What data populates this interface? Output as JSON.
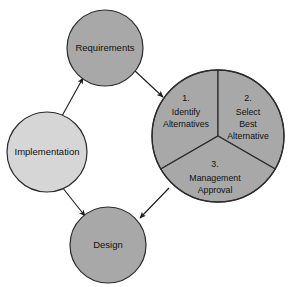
{
  "diagram": {
    "colors": {
      "node_fill": "#a8a8a8",
      "node_fill_light": "#d6d6d6",
      "stroke": "#2b2b2b",
      "background": "#ffffff",
      "text": "#111111"
    },
    "nodes": [
      {
        "id": "requirements",
        "label": "Requirements",
        "cx": 105,
        "cy": 48,
        "r": 38,
        "fill": "#a8a8a8"
      },
      {
        "id": "implementation",
        "label": "Implementation",
        "cx": 47,
        "cy": 152,
        "r": 40,
        "fill": "#d6d6d6"
      },
      {
        "id": "design",
        "label": "Design",
        "cx": 108,
        "cy": 245,
        "r": 38,
        "fill": "#a8a8a8"
      }
    ],
    "pie": {
      "id": "decision-pie",
      "cx": 218,
      "cy": 136,
      "r": 66,
      "fill": "#a8a8a8",
      "segments": [
        {
          "id": "segment-1",
          "number": "1.",
          "lines": [
            "Identify",
            "Alternatives"
          ],
          "start_angle": 0,
          "end_angle": 120
        },
        {
          "id": "segment-2",
          "number": "2.",
          "lines": [
            "Select",
            "Best",
            "Alternative"
          ],
          "start_angle": 120,
          "end_angle": 240
        },
        {
          "id": "segment-3",
          "number": "3.",
          "lines": [
            "Management",
            "Approval"
          ],
          "start_angle": 240,
          "end_angle": 360
        }
      ]
    },
    "arrows": [
      {
        "id": "implementation-to-requirements",
        "from": "implementation",
        "to": "requirements",
        "x1": 62,
        "y1": 116,
        "x2": 83,
        "y2": 78
      },
      {
        "id": "requirements-to-pie",
        "from": "requirements",
        "to": "decision-pie",
        "x1": 134,
        "y1": 70,
        "x2": 163,
        "y2": 97
      },
      {
        "id": "pie-to-design",
        "from": "decision-pie",
        "to": "design",
        "x1": 169,
        "y1": 188,
        "x2": 140,
        "y2": 218
      },
      {
        "id": "implementation-to-design",
        "from": "implementation",
        "to": "design",
        "x1": 62,
        "y1": 187,
        "x2": 85,
        "y2": 216
      }
    ]
  }
}
